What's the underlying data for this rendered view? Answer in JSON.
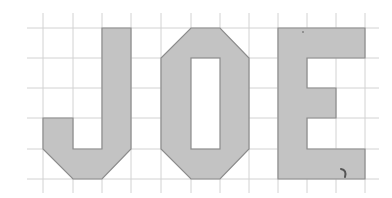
{
  "grid": {
    "columns_x": [
      43,
      73,
      102,
      131,
      161,
      191,
      220,
      249,
      278,
      307,
      336,
      365
    ],
    "rows_y": [
      28,
      58,
      88,
      118,
      149,
      179
    ],
    "h_extent": [
      27,
      379
    ],
    "v_extent": [
      13,
      193
    ],
    "line_color": "#d2d2d2"
  },
  "colors": {
    "fill": "#c3c3c3",
    "stroke": "#8c8c8c",
    "background": "#ffffff"
  },
  "letters": [
    {
      "char": "J",
      "points": "102,28 131,28 131,149 102,179 73,179 43,149 43,118 73,118 73,149 102,149"
    },
    {
      "char": "O",
      "points": "191,28 220,28 249,58 249,149 220,179 191,179 161,149 161,58",
      "hole": {
        "x": 191,
        "y": 58,
        "w": 29,
        "h": 91
      }
    },
    {
      "char": "E",
      "points": "278,28 365,28 365,58 307,58 307,88 336,88 336,118 307,118 307,149 365,149 365,179 278,179"
    }
  ],
  "annotations": {
    "scribble_path": "M341,169 Q347,170 345,177"
  }
}
